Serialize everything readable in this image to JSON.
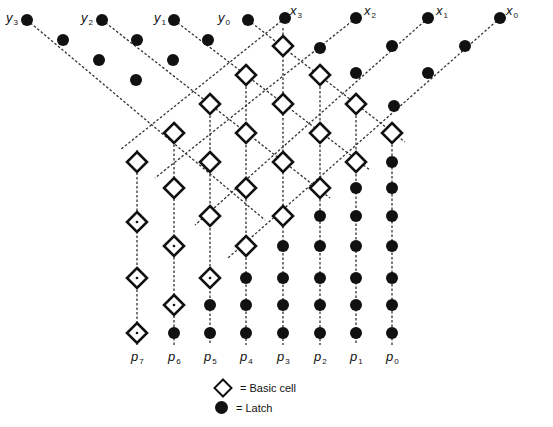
{
  "diagram": {
    "type": "systolic-array-multiplier",
    "inputs_y": [
      {
        "name": "y",
        "index": "3",
        "x": 20,
        "y": 20
      },
      {
        "name": "y",
        "index": "2",
        "x": 95,
        "y": 20
      },
      {
        "name": "y",
        "index": "1",
        "x": 168,
        "y": 20
      },
      {
        "name": "y",
        "index": "0",
        "x": 232,
        "y": 20
      }
    ],
    "inputs_x": [
      {
        "name": "x",
        "index": "3",
        "x": 302,
        "y": 16
      },
      {
        "name": "x",
        "index": "2",
        "x": 376,
        "y": 16
      },
      {
        "name": "x",
        "index": "1",
        "x": 448,
        "y": 16
      },
      {
        "name": "x",
        "index": "0",
        "x": 518,
        "y": 16
      }
    ],
    "outputs": [
      {
        "name": "p",
        "index": "7",
        "x": 137
      },
      {
        "name": "p",
        "index": "6",
        "x": 174
      },
      {
        "name": "p",
        "index": "5",
        "x": 210
      },
      {
        "name": "p",
        "index": "4",
        "x": 246
      },
      {
        "name": "p",
        "index": "3",
        "x": 283
      },
      {
        "name": "p",
        "index": "2",
        "x": 320
      },
      {
        "name": "p",
        "index": "1",
        "x": 356
      },
      {
        "name": "p",
        "index": "0",
        "x": 392
      }
    ],
    "input_latches_y": [
      [
        [
          27,
          20
        ],
        [
          63,
          40
        ],
        [
          99,
          60
        ],
        [
          136,
          80
        ]
      ],
      [
        [
          102,
          20
        ],
        [
          137,
          40
        ],
        [
          173,
          60
        ]
      ],
      [
        [
          174,
          20
        ],
        [
          208,
          40
        ]
      ],
      [
        [
          248,
          20
        ]
      ]
    ],
    "input_latches_x": [
      [
        [
          285,
          18
        ]
      ],
      [
        [
          356,
          18
        ],
        [
          320,
          48
        ]
      ],
      [
        [
          428,
          18
        ],
        [
          392,
          46
        ],
        [
          356,
          73
        ]
      ],
      [
        [
          500,
          18
        ],
        [
          465,
          46
        ],
        [
          428,
          73
        ],
        [
          394,
          106
        ]
      ]
    ],
    "basic_cells": [
      [
        283,
        46
      ],
      [
        246,
        75
      ],
      [
        320,
        75
      ],
      [
        210,
        104
      ],
      [
        283,
        104
      ],
      [
        356,
        104
      ],
      [
        174,
        133
      ],
      [
        246,
        133
      ],
      [
        320,
        133
      ],
      [
        392,
        133
      ],
      [
        137,
        162
      ],
      [
        210,
        162
      ],
      [
        283,
        162
      ],
      [
        356,
        162
      ],
      [
        174,
        188
      ],
      [
        246,
        188
      ],
      [
        320,
        188
      ],
      [
        210,
        216
      ],
      [
        283,
        216
      ],
      [
        246,
        246
      ]
    ],
    "passthrough_cells": [
      [
        137,
        222
      ],
      [
        137,
        278
      ],
      [
        137,
        333
      ],
      [
        174,
        246
      ],
      [
        174,
        305
      ],
      [
        210,
        278
      ]
    ],
    "output_latches": [
      [
        392,
        162
      ],
      [
        392,
        188
      ],
      [
        392,
        216
      ],
      [
        392,
        246
      ],
      [
        392,
        278
      ],
      [
        392,
        305
      ],
      [
        392,
        333
      ],
      [
        356,
        188
      ],
      [
        356,
        216
      ],
      [
        356,
        246
      ],
      [
        356,
        278
      ],
      [
        356,
        305
      ],
      [
        356,
        333
      ],
      [
        320,
        216
      ],
      [
        320,
        246
      ],
      [
        320,
        278
      ],
      [
        320,
        305
      ],
      [
        320,
        333
      ],
      [
        283,
        246
      ],
      [
        283,
        278
      ],
      [
        283,
        305
      ],
      [
        283,
        333
      ],
      [
        246,
        278
      ],
      [
        246,
        305
      ],
      [
        246,
        333
      ],
      [
        210,
        305
      ],
      [
        210,
        333
      ],
      [
        174,
        333
      ]
    ],
    "output_label_y": 350,
    "column_bottom_y": 345
  },
  "legend": {
    "basic_cell_label": "= Basic cell",
    "latch_label": "= Latch"
  },
  "colors": {
    "ink": "#111111",
    "background": "#ffffff",
    "line": "#333333"
  }
}
